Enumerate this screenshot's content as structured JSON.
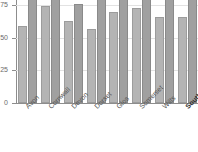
{
  "chart_data": {
    "type": "bar",
    "title": "",
    "subtitle": "",
    "xlabel": "",
    "ylabel": "",
    "ylim": [
      0,
      75
    ],
    "yticks": [
      0,
      25,
      50,
      75
    ],
    "ytick_labels": [
      "0",
      "25",
      "50",
      "75"
    ],
    "grid": true,
    "legend": "none",
    "categories": [
      "Avon",
      "Cornwall",
      "Devon",
      "Dorset",
      "Glos",
      "Somerset",
      "Wilts",
      "South West"
    ],
    "emphasis_category": "South West",
    "series": [
      {
        "name": "series-a",
        "color": "#b4b4b4",
        "values": [
          59,
          74,
          63,
          57,
          70,
          73,
          66,
          66
        ]
      },
      {
        "name": "series-b",
        "color": "#a0a0a0",
        "values": [
          80,
          80,
          76,
          80,
          80,
          80,
          80,
          80
        ]
      }
    ]
  },
  "axis": {
    "y_tick_0": "0",
    "y_tick_25": "25",
    "y_tick_50": "50",
    "y_tick_75": "75"
  },
  "colors": {
    "series_a": "#b4b4b4",
    "series_b": "#a0a0a0",
    "axis": "#8d8d8d",
    "grid": "#e2e2e2",
    "background": "#ffffff",
    "label": "#555555"
  }
}
